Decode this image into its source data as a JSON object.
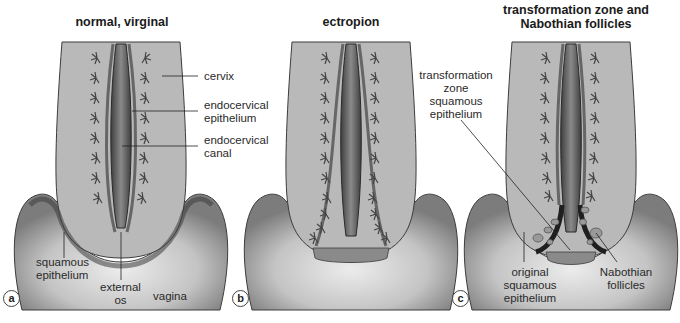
{
  "panels": [
    {
      "letter": "a",
      "title": "normal, virginal",
      "labels": {
        "cervix": "cervix",
        "endocervical_epithelium": "endocervical\nepithelium",
        "endocervical_canal": "endocervical\ncanal",
        "squamous_epithelium": "squamous\nepithelium",
        "external_os": "external\nos",
        "vagina": "vagina"
      }
    },
    {
      "letter": "b",
      "title": "ectropion"
    },
    {
      "letter": "c",
      "title": "transformation zone and\nNabothian follicles",
      "labels": {
        "transformation_zone": "transformation\nzone\nsquamous\nepithelium",
        "original_squamous": "original\nsquamous\nepithelium",
        "nabothian": "Nabothian\nfollicles"
      }
    }
  ],
  "colors": {
    "tissue": "#b9b9b9",
    "vagina_outer": "#8d8d8d",
    "vagina_inner": "#d8d8d8",
    "canal": "#5a5a5a",
    "squamous_dark": "#1f1f1f",
    "outline": "#3c3c3c"
  }
}
